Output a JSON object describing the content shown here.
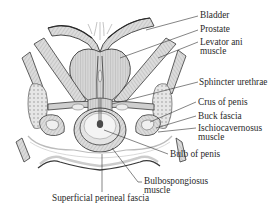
{
  "figure": {
    "type": "anatomical-diagram",
    "colors": {
      "outline": "#3a3a3a",
      "muscle_fill": "#d9d9d9",
      "muscle_stripe": "#9a9a9a",
      "leader_line": "#333333",
      "background": "#ffffff",
      "dark_accent": "#4a4a4a"
    }
  },
  "labels": {
    "bladder": "Bladder",
    "prostate": "Prostate",
    "levator_ani_1": "Levator ani",
    "levator_ani_2": "muscle",
    "sphincter_urethrae": "Sphincter urethrae",
    "crus_of_penis": "Crus of penis",
    "buck_fascia": "Buck fascia",
    "ischiocavernosus_1": "Ischiocavernosus",
    "ischiocavernosus_2": "muscle",
    "bulb_of_penis": "Bulb of penis",
    "bulbospongiosus_1": "Bulbospongiosus",
    "bulbospongiosus_2": "muscle",
    "superficial_perineal_fascia": "Superficial perineal fascia"
  }
}
